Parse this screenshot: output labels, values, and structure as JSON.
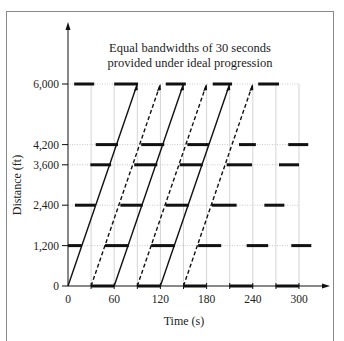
{
  "chart_data": {
    "type": "line",
    "title": "Equal bandwidths of 30 seconds provided under ideal progression",
    "title_lines": [
      "Equal bandwidths of 30 seconds",
      "provided under ideal progression"
    ],
    "xlabel": "Time (s)",
    "ylabel": "Distance (ft)",
    "xlim": [
      0,
      300
    ],
    "ylim": [
      0,
      6000
    ],
    "x_ticks": [
      0,
      60,
      120,
      180,
      240,
      300
    ],
    "x_tick_labels": [
      "0",
      "60",
      "120",
      "180",
      "240",
      "300"
    ],
    "y_ticks": [
      0,
      1200,
      2400,
      3600,
      4200,
      6000
    ],
    "y_tick_labels": [
      "0",
      "1,200",
      "2,400",
      "3,600",
      "4,200",
      "6,000"
    ],
    "grid": {
      "vertical_every_s": 30,
      "horizontal_at_ticks": true
    },
    "green_bands": [
      {
        "distance": 6000,
        "intervals": [
          [
            8,
            34
          ],
          [
            60,
            91
          ],
          [
            127,
            153
          ],
          [
            188,
            213
          ],
          [
            247,
            274
          ]
        ]
      },
      {
        "distance": 4200,
        "intervals": [
          [
            36,
            65
          ],
          [
            95,
            125
          ],
          [
            155,
            183
          ],
          [
            222,
            244
          ],
          [
            286,
            312
          ]
        ]
      },
      {
        "distance": 3600,
        "intervals": [
          [
            29,
            56
          ],
          [
            86,
            116
          ],
          [
            145,
            175
          ],
          [
            206,
            239
          ],
          [
            274,
            300
          ]
        ]
      },
      {
        "distance": 2400,
        "intervals": [
          [
            9,
            36
          ],
          [
            68,
            97
          ],
          [
            127,
            157
          ],
          [
            187,
            219
          ],
          [
            255,
            281
          ]
        ]
      },
      {
        "distance": 1200,
        "intervals": [
          [
            0,
            18
          ],
          [
            48,
            79
          ],
          [
            108,
            139
          ],
          [
            169,
            199
          ],
          [
            232,
            260
          ],
          [
            290,
            316
          ]
        ]
      },
      {
        "distance": 0,
        "intervals": [
          [
            30,
            60
          ],
          [
            90,
            120
          ],
          [
            150,
            180
          ],
          [
            210,
            240
          ],
          [
            270,
            300
          ]
        ]
      }
    ],
    "series": [
      {
        "name": "band-1 front (solid)",
        "style": "solid",
        "x": [
          0,
          90
        ],
        "y": [
          0,
          6000
        ]
      },
      {
        "name": "band-1 rear (dashed)",
        "style": "dashed",
        "x": [
          30,
          120
        ],
        "y": [
          0,
          6000
        ]
      },
      {
        "name": "band-2 front (solid)",
        "style": "solid",
        "x": [
          60,
          150
        ],
        "y": [
          0,
          6000
        ]
      },
      {
        "name": "band-2 rear (dashed)",
        "style": "dashed",
        "x": [
          90,
          180
        ],
        "y": [
          0,
          6000
        ]
      },
      {
        "name": "band-3 front (solid)",
        "style": "solid",
        "x": [
          120,
          210
        ],
        "y": [
          0,
          6000
        ]
      },
      {
        "name": "band-3 rear (dashed)",
        "style": "dashed",
        "x": [
          150,
          240
        ],
        "y": [
          0,
          6000
        ]
      }
    ]
  }
}
